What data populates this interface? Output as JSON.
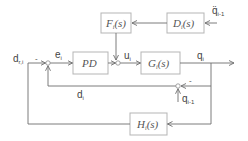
{
  "blocks": {
    "F": "F",
    "F_sub": "i",
    "F_tail": "(s)",
    "D": "D",
    "D_sub": "i",
    "D_tail": "(s)",
    "PD": "PD",
    "G": "G",
    "G_sub": "i",
    "G_tail": "(s)",
    "H": "H",
    "H_sub": "i",
    "H_tail": "(s)"
  },
  "signals": {
    "qdd_prev": "q̈",
    "qdd_prev_sub": "i-1",
    "d_ref": "d",
    "d_ref_sub": "r,i",
    "e": "e",
    "e_sub": "i",
    "u": "u",
    "u_sub": "i",
    "q": "q",
    "q_sub": "i",
    "d": "d",
    "d_sub": "i",
    "q_prev": "q",
    "q_prev_sub": "i-1"
  },
  "signs": {
    "sum1_minus": "-",
    "sum3_minus": "-"
  },
  "colors": {
    "line": "#6e6e6e",
    "block_border": "#b5b5b5",
    "text": "#444444"
  }
}
